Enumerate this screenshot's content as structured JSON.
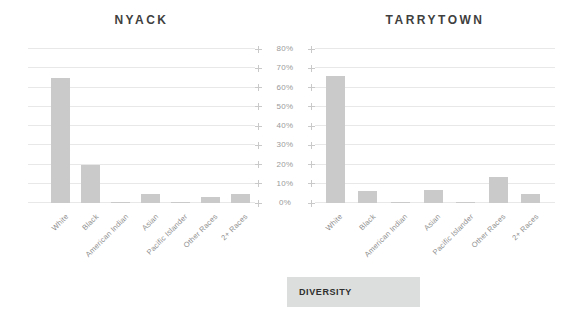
{
  "chart_data": [
    {
      "type": "bar",
      "title": "NYACK",
      "categories": [
        "White",
        "Black",
        "American Indian",
        "Asian",
        "Pacific Islander",
        "Other Races",
        "2+ Races"
      ],
      "values": [
        65,
        20,
        0.5,
        4.5,
        0.3,
        3,
        4.5
      ],
      "xlabel": "",
      "ylabel": "",
      "ylim": [
        0,
        80
      ],
      "grid": true,
      "bar_color": "#c9cac9"
    },
    {
      "type": "bar",
      "title": "TARRYTOWN",
      "categories": [
        "White",
        "Black",
        "American Indian",
        "Asian",
        "Pacific Islander",
        "Other Races",
        "2+ Races"
      ],
      "values": [
        66,
        6,
        0.4,
        7,
        0.3,
        13.5,
        4.5
      ],
      "xlabel": "",
      "ylabel": "",
      "ylim": [
        0,
        80
      ],
      "grid": true,
      "bar_color": "#c9cac9"
    }
  ],
  "y_axis": {
    "labels": [
      "80%",
      "70%",
      "60%",
      "50%",
      "40%",
      "30%",
      "20%",
      "10%",
      "0%"
    ],
    "position": "center-shared"
  },
  "footer": {
    "label": "DIVERSITY",
    "background": "#dcdedd"
  },
  "colors": {
    "bar": "#c9cac9",
    "gridline": "#e8e8e8",
    "tick_text": "#9a9a9a",
    "category_text": "#8f8f8f",
    "title_text": "#3f3f3f",
    "marker": "#c9c9c9",
    "footer_bg": "#dcdedd",
    "footer_text": "#2e2e2e"
  }
}
